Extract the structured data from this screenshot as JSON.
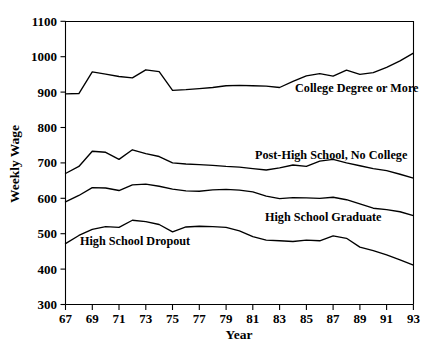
{
  "chart_data": {
    "type": "line",
    "title": "",
    "xlabel": "Year",
    "ylabel": "Weekly Wage",
    "xlim": [
      67,
      93
    ],
    "ylim": [
      300,
      1100
    ],
    "grid": false,
    "legend_position": "inline-annotations",
    "x": [
      67,
      68,
      69,
      70,
      71,
      72,
      73,
      74,
      75,
      76,
      77,
      78,
      79,
      80,
      81,
      82,
      83,
      84,
      85,
      86,
      87,
      88,
      89,
      90,
      91,
      92,
      93
    ],
    "x_tick_labels": [
      "67",
      "69",
      "71",
      "73",
      "75",
      "77",
      "79",
      "81",
      "83",
      "85",
      "87",
      "89",
      "91",
      "93"
    ],
    "y_tick_labels": [
      "300",
      "400",
      "500",
      "600",
      "700",
      "800",
      "900",
      "1000",
      "1100"
    ],
    "series": [
      {
        "name": "College Degree or More",
        "label_text": "College Degree or More",
        "values": [
          895,
          896,
          957,
          951,
          944,
          940,
          963,
          958,
          905,
          907,
          910,
          913,
          918,
          919,
          918,
          917,
          913,
          930,
          946,
          952,
          945,
          962,
          950,
          955,
          970,
          988,
          1010
        ]
      },
      {
        "name": "Post-High School, No College",
        "label_text": "Post-High School, No College",
        "values": [
          670,
          690,
          733,
          730,
          710,
          737,
          726,
          718,
          700,
          697,
          695,
          693,
          690,
          688,
          684,
          680,
          686,
          694,
          690,
          705,
          710,
          700,
          692,
          684,
          678,
          668,
          657
        ]
      },
      {
        "name": "High School Graduate",
        "label_text": "High School Graduate",
        "values": [
          590,
          608,
          630,
          629,
          622,
          638,
          640,
          634,
          626,
          621,
          620,
          624,
          625,
          623,
          618,
          606,
          599,
          602,
          601,
          600,
          603,
          596,
          584,
          572,
          568,
          562,
          551
        ]
      },
      {
        "name": "High School Dropout",
        "label_text": "High School Dropout",
        "values": [
          472,
          495,
          512,
          520,
          518,
          538,
          534,
          526,
          505,
          519,
          521,
          520,
          518,
          508,
          492,
          482,
          480,
          478,
          482,
          480,
          494,
          487,
          462,
          452,
          440,
          426,
          411
        ]
      }
    ],
    "annotations": [
      {
        "text": "College Degree or More",
        "x_year": 84.0,
        "y_value": 880
      },
      {
        "text": "Post-High School, No College",
        "x_year": 83.4,
        "y_value": 740
      },
      {
        "text": "High School Graduate",
        "x_year": 80.0,
        "y_value": 565
      },
      {
        "text": "High School Dropout",
        "x_year": 70.2,
        "y_value": 470
      }
    ],
    "colors": {
      "line": "#000000",
      "axis": "#000000",
      "background": "#ffffff"
    }
  }
}
